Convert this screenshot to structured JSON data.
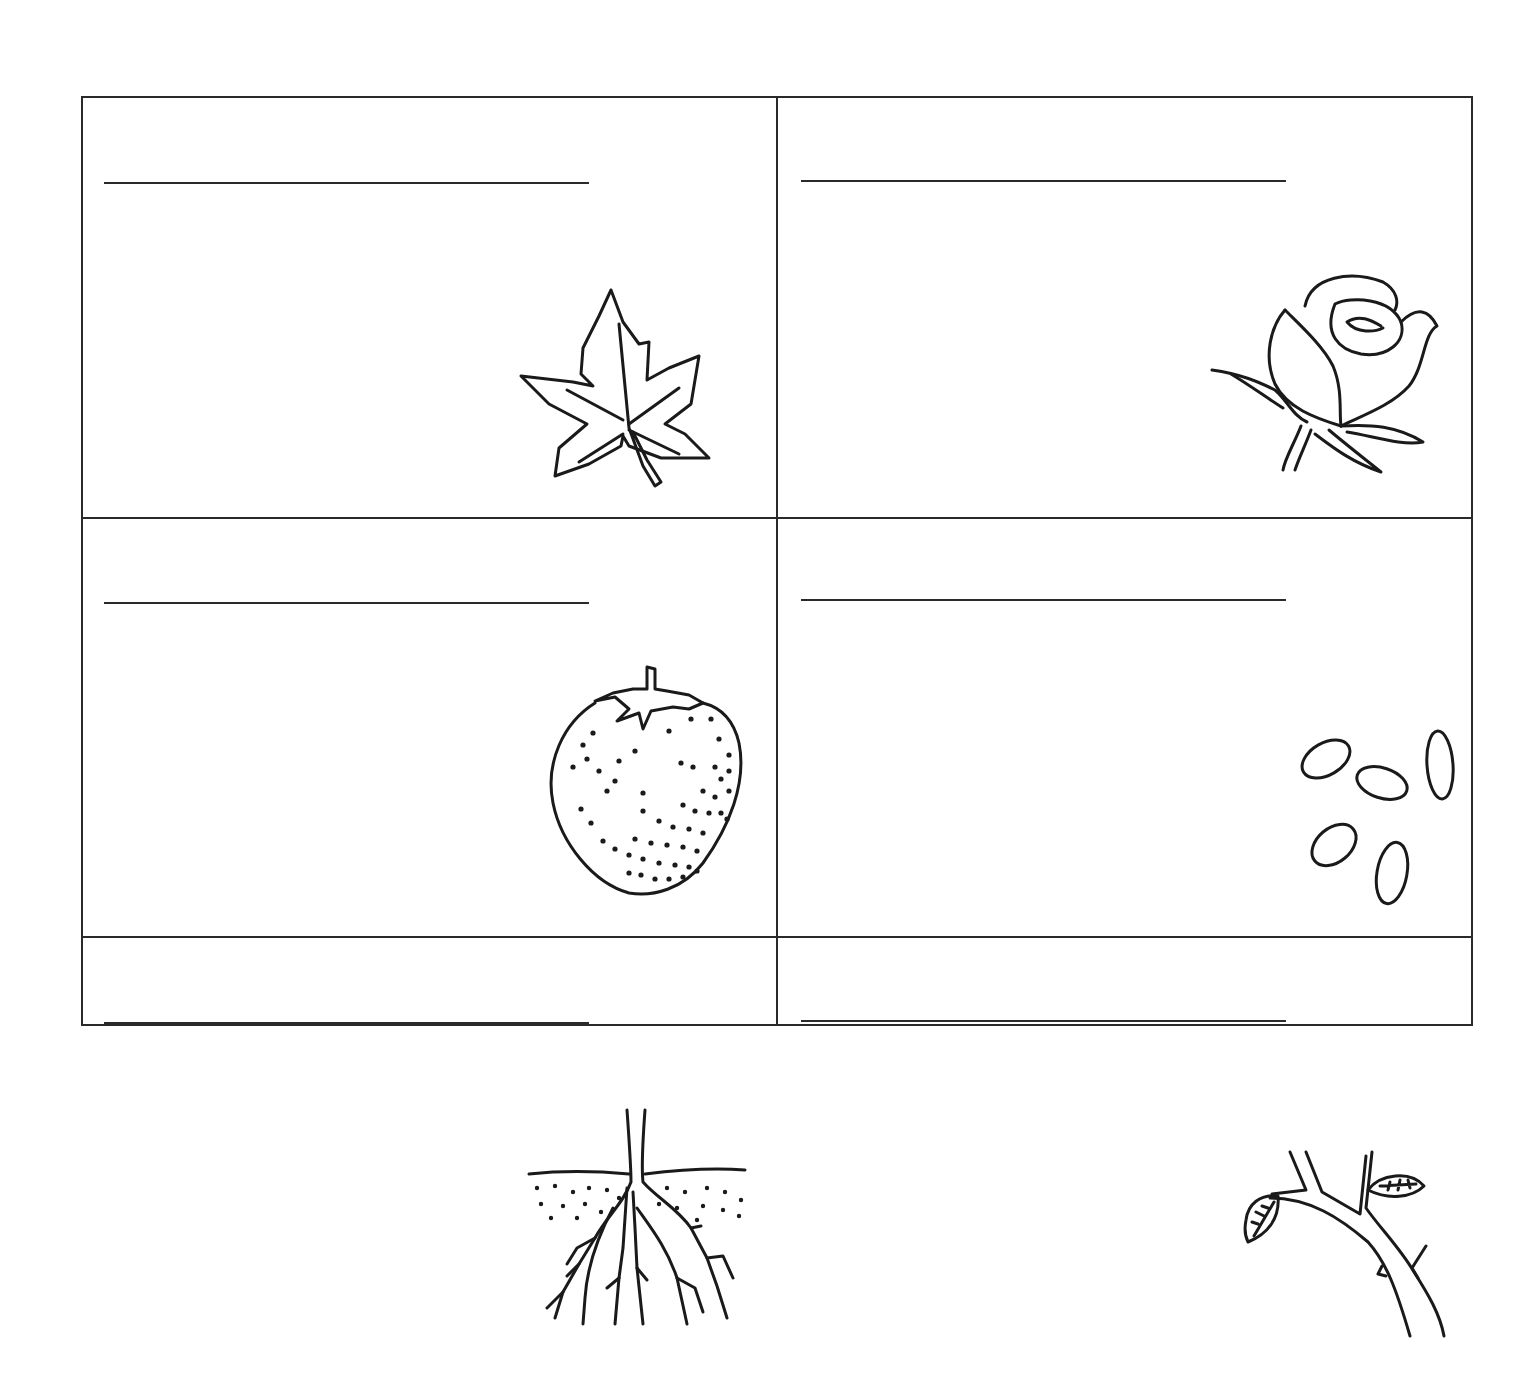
{
  "worksheet": {
    "layout": {
      "columns": 2,
      "rows": 3
    },
    "line_color": "#2a2a2a",
    "cells": [
      {
        "position": "row-1-col-1",
        "answer": {
          "value": "",
          "placeholder": ""
        },
        "picture": "leaf-icon"
      },
      {
        "position": "row-1-col-2",
        "answer": {
          "value": "",
          "placeholder": ""
        },
        "picture": "flower-icon"
      },
      {
        "position": "row-2-col-1",
        "answer": {
          "value": "",
          "placeholder": ""
        },
        "picture": "fruit-strawberry-icon"
      },
      {
        "position": "row-2-col-2",
        "answer": {
          "value": "",
          "placeholder": ""
        },
        "picture": "seeds-icon"
      },
      {
        "position": "row-3-col-1",
        "answer": {
          "value": "",
          "placeholder": ""
        },
        "picture": "roots-icon"
      },
      {
        "position": "row-3-col-2",
        "answer": {
          "value": "",
          "placeholder": ""
        },
        "picture": "stem-icon"
      }
    ]
  }
}
